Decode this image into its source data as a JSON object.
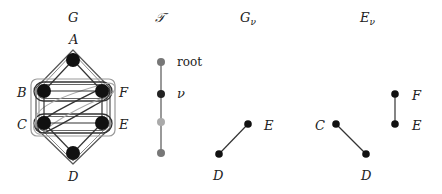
{
  "panels": {
    "G": {
      "title": "G",
      "nodes": [
        {
          "id": "A",
          "label": "A"
        },
        {
          "id": "B",
          "label": "B"
        },
        {
          "id": "F",
          "label": "F"
        },
        {
          "id": "C",
          "label": "C"
        },
        {
          "id": "E",
          "label": "E"
        },
        {
          "id": "D",
          "label": "D"
        }
      ],
      "edges": [
        [
          "A",
          "B"
        ],
        [
          "A",
          "F"
        ],
        [
          "B",
          "F"
        ],
        [
          "C",
          "E"
        ],
        [
          "B",
          "C"
        ],
        [
          "F",
          "E"
        ],
        [
          "C",
          "D"
        ],
        [
          "E",
          "D"
        ],
        [
          "C",
          "F"
        ]
      ],
      "bags": [
        "A-B-F-E-D-C hull",
        "B-F pair",
        "C-E pair",
        "B-C-E-F box",
        "C-F diagonal hull"
      ]
    },
    "T": {
      "title": "𝒯",
      "nodes": [
        {
          "label": "root",
          "color": "#777777"
        },
        {
          "label": "ν",
          "color": "#222222"
        },
        {
          "label": "",
          "color": "#aaaaaa"
        },
        {
          "label": "",
          "color": "#777777"
        }
      ]
    },
    "G_nu": {
      "title": "G",
      "subscript": "ν",
      "nodes": [
        {
          "label": "E"
        },
        {
          "label": "D"
        }
      ],
      "edges": [
        [
          "D",
          "E"
        ]
      ]
    },
    "E_nu": {
      "title": "E",
      "subscript": "ν",
      "nodes": [
        {
          "label": "F"
        },
        {
          "label": "E"
        },
        {
          "label": "C"
        },
        {
          "label": "D"
        }
      ],
      "edges": [
        [
          "F",
          "E"
        ],
        [
          "C",
          "D"
        ]
      ]
    }
  },
  "colors": {
    "node": "#111111",
    "edge": "#333333",
    "bag_dark": "#444444",
    "bag_light": "#999999"
  }
}
